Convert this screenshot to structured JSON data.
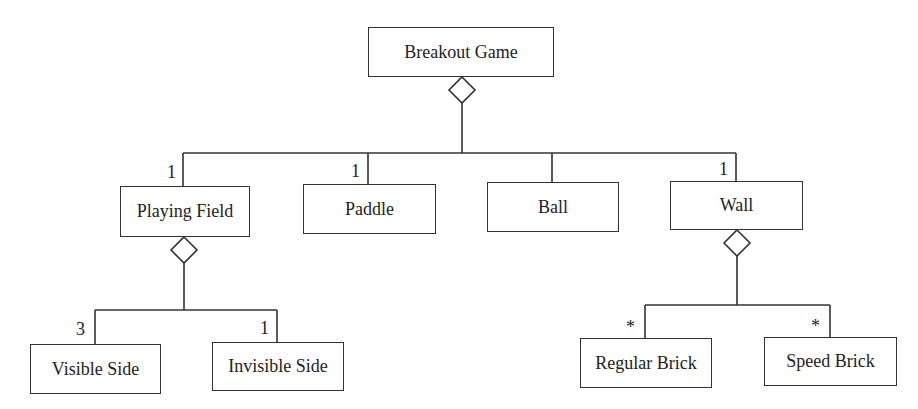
{
  "diagram": {
    "type": "UML aggregation hierarchy",
    "nodes": {
      "root": {
        "label": "Breakout Game"
      },
      "playing_field": {
        "label": "Playing Field",
        "multiplicity": "1"
      },
      "paddle": {
        "label": "Paddle",
        "multiplicity": "1"
      },
      "ball": {
        "label": "Ball",
        "multiplicity": ""
      },
      "wall": {
        "label": "Wall",
        "multiplicity": "1"
      },
      "visible_side": {
        "label": "Visible Side",
        "multiplicity": "3"
      },
      "invisible_side": {
        "label": "Invisible Side",
        "multiplicity": "1"
      },
      "regular_brick": {
        "label": "Regular Brick",
        "multiplicity": "*"
      },
      "speed_brick": {
        "label": "Speed Brick",
        "multiplicity": "*"
      }
    },
    "edges": [
      {
        "from": "root",
        "to": "playing_field",
        "kind": "aggregation"
      },
      {
        "from": "root",
        "to": "paddle",
        "kind": "aggregation"
      },
      {
        "from": "root",
        "to": "ball",
        "kind": "aggregation"
      },
      {
        "from": "root",
        "to": "wall",
        "kind": "aggregation"
      },
      {
        "from": "playing_field",
        "to": "visible_side",
        "kind": "aggregation"
      },
      {
        "from": "playing_field",
        "to": "invisible_side",
        "kind": "aggregation"
      },
      {
        "from": "wall",
        "to": "regular_brick",
        "kind": "aggregation"
      },
      {
        "from": "wall",
        "to": "speed_brick",
        "kind": "aggregation"
      }
    ]
  }
}
